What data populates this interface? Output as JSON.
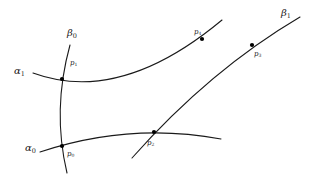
{
  "diagram": {
    "curves": [
      {
        "id": "alpha1",
        "label": "α",
        "sub": "1",
        "path": "M33,73 Q120,105 222,20"
      },
      {
        "id": "alpha0",
        "label": "α",
        "sub": "0",
        "path": "M40,152 Q130,122 221,139"
      },
      {
        "id": "beta0",
        "label": "β",
        "sub": "0",
        "path": "M70,45 Q52,110 67,173"
      },
      {
        "id": "beta1",
        "label": "β",
        "sub": "1",
        "path": "M132,158 Q210,70 300,17"
      }
    ],
    "points": [
      {
        "id": "p0",
        "label": "p",
        "sub": "0",
        "x": 62,
        "y": 146
      },
      {
        "id": "p1",
        "label": "p",
        "sub": "1",
        "x": 62,
        "y": 79
      },
      {
        "id": "p2",
        "label": "p",
        "sub": "2",
        "x": 154,
        "y": 132
      },
      {
        "id": "p3",
        "label": "p",
        "sub": "3",
        "x": 252,
        "y": 45
      },
      {
        "id": "p4",
        "label": "p",
        "sub": "4",
        "x": 202,
        "y": 39
      }
    ],
    "labels": {
      "alpha1": {
        "text": "α",
        "sub": "1"
      },
      "alpha0": {
        "text": "α",
        "sub": "0"
      },
      "beta0": {
        "text": "β",
        "sub": "0"
      },
      "beta1": {
        "text": "β",
        "sub": "1"
      },
      "p0": {
        "text": "p",
        "sub": "0"
      },
      "p1": {
        "text": "p",
        "sub": "1"
      },
      "p2": {
        "text": "p",
        "sub": "2"
      },
      "p3": {
        "text": "p",
        "sub": "3"
      },
      "p4": {
        "text": "p",
        "sub": "4"
      }
    },
    "colors": {
      "stroke": "#1a1a1a",
      "point": "#000000",
      "background": "#ffffff"
    }
  }
}
